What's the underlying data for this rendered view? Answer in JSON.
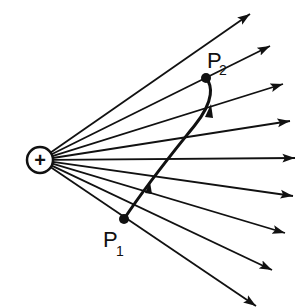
{
  "diagram": {
    "charge": {
      "symbol": "+",
      "cx": 40,
      "cy": 160,
      "r": 13
    },
    "field_lines": [
      {
        "x2": 250,
        "y2": 14
      },
      {
        "x2": 270,
        "y2": 46
      },
      {
        "x2": 283,
        "y2": 84
      },
      {
        "x2": 290,
        "y2": 121
      },
      {
        "x2": 295,
        "y2": 158
      },
      {
        "x2": 293,
        "y2": 196
      },
      {
        "x2": 285,
        "y2": 233
      },
      {
        "x2": 272,
        "y2": 270
      },
      {
        "x2": 256,
        "y2": 306
      }
    ],
    "points": {
      "p1": {
        "label": "P",
        "sub": "1",
        "x": 124,
        "y": 219
      },
      "p2": {
        "label": "P",
        "sub": "2",
        "x": 206,
        "y": 78
      }
    },
    "colors": {
      "ink": "#111111",
      "background": "#ffffff"
    }
  }
}
